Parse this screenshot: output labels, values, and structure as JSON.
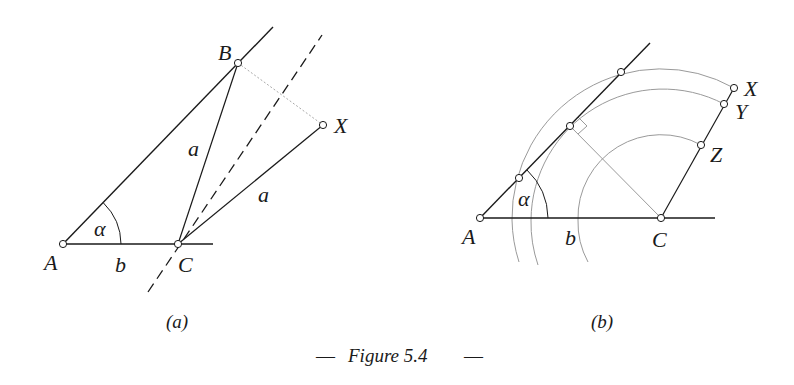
{
  "figure": {
    "caption_dash_left": "—",
    "caption_text": "Figure 5.4",
    "caption_dash_right": "—"
  },
  "panel_a": {
    "sublabel": "(a)",
    "points": {
      "A": "A",
      "B": "B",
      "C": "C",
      "X": "X"
    },
    "labels": {
      "side_a_1": "a",
      "side_a_2": "a",
      "side_b": "b",
      "angle": "α"
    }
  },
  "panel_b": {
    "sublabel": "(b)",
    "points": {
      "A": "A",
      "C": "C",
      "X": "X",
      "Y": "Y",
      "Z": "Z"
    },
    "labels": {
      "side_b": "b",
      "angle": "α"
    }
  },
  "colors": {
    "ink": "#1a1a1a",
    "construction": "#9a9a9a",
    "dotted": "#aaaaaa"
  }
}
